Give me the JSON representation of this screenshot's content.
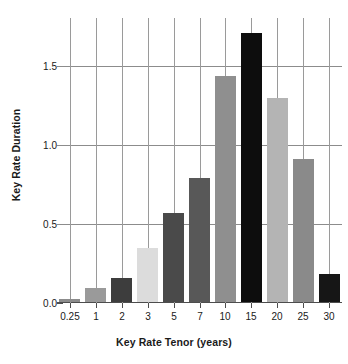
{
  "chart_data": {
    "type": "bar",
    "title": "",
    "xlabel": "Key Rate Tenor (years)",
    "ylabel": "Key Rate Duration",
    "categories": [
      "0.25",
      "1",
      "2",
      "3",
      "5",
      "7",
      "10",
      "15",
      "20",
      "25",
      "30"
    ],
    "values": [
      0.02,
      0.09,
      0.15,
      0.34,
      0.56,
      0.78,
      1.43,
      1.7,
      1.29,
      0.9,
      0.18
    ],
    "bar_colors": [
      "#8c8c8c",
      "#9a9a9a",
      "#3d3d3d",
      "#dcdcdc",
      "#4a4a4a",
      "#585858",
      "#8f8f8f",
      "#0d0d0d",
      "#b4b4b4",
      "#8a8a8a",
      "#161616"
    ],
    "ylim": [
      0.0,
      1.8
    ],
    "yticks": [
      0.0,
      0.5,
      1.0,
      1.5
    ],
    "ytick_labels": [
      "0.0",
      "0.5",
      "1.0",
      "1.5"
    ],
    "grid": "horizontal-and-vertical",
    "legend": "none",
    "axis_color": "#4d4d4d",
    "grid_color": "#8c8c8c",
    "text_color": "#1a1a1a",
    "background": "#ffffff"
  }
}
